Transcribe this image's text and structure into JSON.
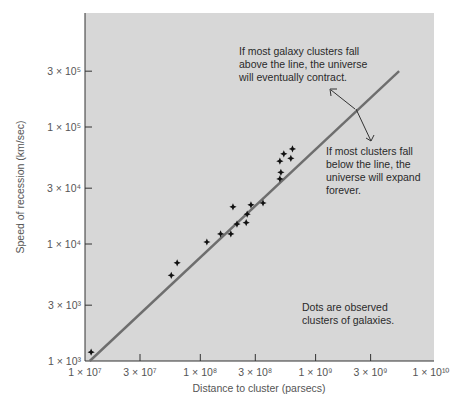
{
  "chart_data": {
    "type": "scatter",
    "title": "",
    "xlabel": "Distance to cluster (parsecs)",
    "ylabel": "Speed of recession (km/sec)",
    "xscale": "log",
    "yscale": "log",
    "xlim": [
      10000000.0,
      10000000000.0
    ],
    "ylim": [
      1000.0,
      600000.0
    ],
    "grid": false,
    "x_ticks": [
      {
        "value": 10000000.0,
        "label": "1 × 10⁷"
      },
      {
        "value": 30000000.0,
        "label": "3 × 10⁷"
      },
      {
        "value": 100000000.0,
        "label": "1 × 10⁸"
      },
      {
        "value": 300000000.0,
        "label": "3 × 10⁸"
      },
      {
        "value": 1000000000.0,
        "label": "1 × 10⁹"
      },
      {
        "value": 3000000000.0,
        "label": "3 × 10⁹"
      },
      {
        "value": 10000000000.0,
        "label": "1 × 10¹⁰"
      }
    ],
    "y_ticks": [
      {
        "value": 1000.0,
        "label": "1 × 10³"
      },
      {
        "value": 3000.0,
        "label": "3 × 10³"
      },
      {
        "value": 10000.0,
        "label": "1 × 10⁴"
      },
      {
        "value": 30000.0,
        "label": "3 × 10⁴"
      },
      {
        "value": 100000.0,
        "label": "1 × 10⁵"
      },
      {
        "value": 300000.0,
        "label": "3 × 10⁵"
      }
    ],
    "series": [
      {
        "name": "Observed clusters of galaxies",
        "marker": "star",
        "x": [
          11300000.0,
          56000000.0,
          63000000.0,
          114000000.0,
          150000000.0,
          184000000.0,
          192000000.0,
          208000000.0,
          250000000.0,
          255000000.0,
          275000000.0,
          350000000.0,
          490000000.0,
          500000000.0,
          490000000.0,
          610000000.0,
          530000000.0,
          630000000.0
        ],
        "y": [
          1190.0,
          5400.0,
          6900.0,
          10400.0,
          12200.0,
          12200.0,
          20800.0,
          14800.0,
          15200.0,
          18000.0,
          21600.0,
          22400.0,
          36000.0,
          41000.0,
          51000.0,
          54000.0,
          59000.0,
          65000.0
        ]
      },
      {
        "name": "Critical line",
        "type": "line",
        "x": [
          11000000.0,
          5300000000.0
        ],
        "y": [
          900.0,
          300000.0
        ]
      }
    ],
    "annotations": [
      {
        "text": "If most galaxy clusters fall above the line, the universe will eventually contract.",
        "arrow_direction": "up-left"
      },
      {
        "text": "If most clusters fall below the line, the universe will expand forever.",
        "arrow_direction": "down"
      },
      {
        "text": "Dots are observed clusters of galaxies."
      }
    ]
  },
  "labels": {
    "xlabel": "Distance to cluster (parsecs)",
    "ylabel": "Speed of recession (km/sec)",
    "note_above": [
      "If most galaxy clusters fall",
      "above the line, the universe",
      "will eventually contract."
    ],
    "note_below": [
      "If most clusters fall",
      "below the line, the",
      "universe will expand",
      "forever."
    ],
    "note_dots": [
      "Dots are observed",
      "clusters of galaxies."
    ]
  },
  "colors": {
    "plot_bg": "#d7d7d7",
    "line": "#6e6e6e",
    "points": "#111111",
    "axis": "#333333"
  }
}
